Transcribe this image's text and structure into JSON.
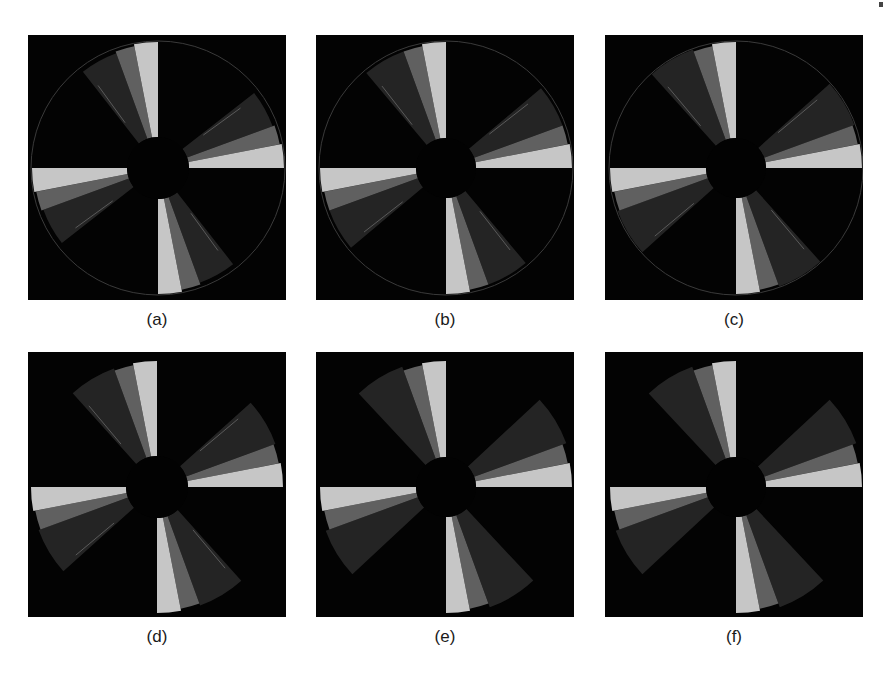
{
  "figure": {
    "colors": {
      "background": "#030303",
      "light": "#c6c6c6",
      "medium": "#606060",
      "dark": "#242424",
      "hub": "#020202",
      "artifact_line": "#5a5a5a"
    },
    "blade_count": 4,
    "panels": [
      {
        "id": "a",
        "label": "(a)",
        "x": 28,
        "y": 35,
        "w": 258,
        "h": 265,
        "cx": 130,
        "cy": 133,
        "hub_r": 31,
        "r_light": 126,
        "r_med": 124,
        "r_dark": 122,
        "light_deg": 11,
        "med_deg": 20,
        "dark_deg": 38,
        "outer_circle": true,
        "artifacts": true
      },
      {
        "id": "b",
        "label": "(b)",
        "x": 316,
        "y": 35,
        "w": 258,
        "h": 265,
        "cx": 130,
        "cy": 133,
        "hub_r": 30,
        "r_light": 126,
        "r_med": 124,
        "r_dark": 124,
        "light_deg": 11,
        "med_deg": 20,
        "dark_deg": 40,
        "outer_circle": true,
        "artifacts": true
      },
      {
        "id": "c",
        "label": "(c)",
        "x": 605,
        "y": 35,
        "w": 258,
        "h": 265,
        "cx": 131,
        "cy": 133,
        "hub_r": 30,
        "r_light": 126,
        "r_med": 124,
        "r_dark": 126,
        "light_deg": 11,
        "med_deg": 20,
        "dark_deg": 42,
        "outer_circle": true,
        "artifacts": true
      },
      {
        "id": "d",
        "label": "(d)",
        "x": 28,
        "y": 352,
        "w": 258,
        "h": 265,
        "cx": 129,
        "cy": 135,
        "hub_r": 31,
        "r_light": 126,
        "r_med": 124,
        "r_dark": 126,
        "light_deg": 11,
        "med_deg": 20,
        "dark_deg": 42,
        "outer_circle": false,
        "artifacts": true
      },
      {
        "id": "e",
        "label": "(e)",
        "x": 316,
        "y": 352,
        "w": 258,
        "h": 265,
        "cx": 130,
        "cy": 135,
        "hub_r": 30,
        "r_light": 126,
        "r_med": 124,
        "r_dark": 128,
        "light_deg": 11,
        "med_deg": 20,
        "dark_deg": 43,
        "outer_circle": false,
        "artifacts": false
      },
      {
        "id": "f",
        "label": "(f)",
        "x": 605,
        "y": 352,
        "w": 258,
        "h": 265,
        "cx": 131,
        "cy": 135,
        "hub_r": 30,
        "r_light": 126,
        "r_med": 124,
        "r_dark": 128,
        "light_deg": 11,
        "med_deg": 20,
        "dark_deg": 43,
        "outer_circle": false,
        "artifacts": false
      }
    ]
  },
  "captions": {
    "a": "(a)",
    "b": "(b)",
    "c": "(c)",
    "d": "(d)",
    "e": "(e)",
    "f": "(f)"
  }
}
